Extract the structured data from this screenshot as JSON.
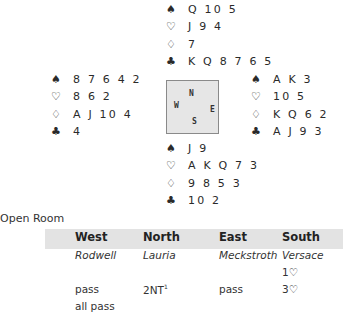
{
  "hands": {
    "north": {
      "spades": "Q 10 5",
      "hearts": "J 9 4",
      "diamonds": "7",
      "clubs": "K Q 8 7 6 5"
    },
    "west": {
      "spades": "8 7 6 4 2",
      "hearts": "8 6 2",
      "diamonds": "A J 10 4",
      "clubs": "4"
    },
    "east": {
      "spades": "A K 3",
      "hearts": "10 5",
      "diamonds": "K Q 6 2",
      "clubs": "A J 9 3"
    },
    "south": {
      "spades": "J 9",
      "hearts": "A K Q 7 3",
      "diamonds": "9 8 5 3",
      "clubs": "10 2"
    }
  },
  "suit_symbols": {
    "spades": "♠",
    "hearts": "♡",
    "diamonds": "♢",
    "clubs": "♣"
  },
  "compass": {
    "north": "N",
    "west": "W",
    "east": "E",
    "south": "S"
  },
  "room_label": "Open Room",
  "auction": {
    "headers": [
      "West",
      "North",
      "East",
      "South"
    ],
    "players": [
      "Rodwell",
      "Lauria",
      "Meckstroth",
      "Versace"
    ],
    "rounds": [
      [
        "",
        "",
        "",
        "1♡"
      ],
      [
        "pass",
        "2NT",
        "pass",
        "3♡"
      ],
      [
        "all pass",
        "",
        "",
        ""
      ]
    ],
    "footnote_marker": "1"
  }
}
